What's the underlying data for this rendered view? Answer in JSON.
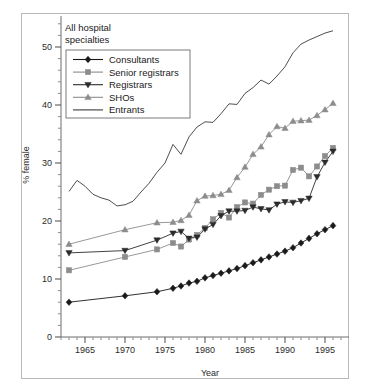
{
  "figure": {
    "annotation_line1": "All hospital",
    "annotation_line2": "specialties",
    "xlabel": "Year",
    "ylabel": "% female"
  },
  "chart_data": {
    "type": "line",
    "title": "All hospital specialties",
    "xlabel": "Year",
    "ylabel": "% female",
    "xlim": [
      1962,
      1997
    ],
    "ylim": [
      0,
      55
    ],
    "xticks": [
      1965,
      1970,
      1975,
      1980,
      1985,
      1990,
      1995
    ],
    "xtick_labels": [
      "1965",
      "1970",
      "1975",
      "1980",
      "1985",
      "1990",
      "1995"
    ],
    "yticks": [
      0,
      10,
      20,
      30,
      40,
      50
    ],
    "ytick_labels": [
      "0",
      "10",
      "20",
      "30",
      "40",
      "50"
    ],
    "minor_x_step": 1,
    "minor_y_step": 2,
    "grid": false,
    "legend_position": "upper-left",
    "series": [
      {
        "name": "Consultants",
        "marker": "diamond",
        "color": "#1a1a1a",
        "x": [
          1963,
          1970,
          1974,
          1976,
          1977,
          1978,
          1979,
          1980,
          1981,
          1982,
          1983,
          1984,
          1985,
          1986,
          1987,
          1988,
          1989,
          1990,
          1991,
          1992,
          1993,
          1994,
          1995,
          1996
        ],
        "y": [
          6.0,
          7.1,
          7.8,
          8.4,
          8.8,
          9.3,
          9.6,
          10.2,
          10.6,
          11.0,
          11.4,
          11.8,
          12.3,
          12.8,
          13.3,
          13.8,
          14.3,
          14.8,
          15.4,
          16.2,
          17.0,
          17.8,
          18.5,
          19.2
        ]
      },
      {
        "name": "Senior registrars",
        "marker": "square",
        "color": "#8c8c8c",
        "x": [
          1963,
          1970,
          1974,
          1976,
          1977,
          1978,
          1979,
          1980,
          1981,
          1982,
          1983,
          1984,
          1985,
          1986,
          1987,
          1988,
          1989,
          1990,
          1991,
          1992,
          1993,
          1994,
          1995,
          1996
        ],
        "y": [
          11.5,
          13.8,
          15.1,
          16.2,
          15.6,
          16.8,
          17.6,
          18.8,
          20.3,
          21.4,
          20.6,
          22.4,
          23.2,
          23.0,
          24.5,
          25.4,
          26.0,
          26.1,
          28.8,
          29.2,
          27.7,
          29.4,
          31.2,
          32.6
        ]
      },
      {
        "name": "Registrars",
        "marker": "triangle-down",
        "color": "#2b2b2b",
        "x": [
          1963,
          1970,
          1974,
          1976,
          1977,
          1978,
          1979,
          1980,
          1981,
          1982,
          1983,
          1984,
          1985,
          1986,
          1987,
          1988,
          1989,
          1990,
          1991,
          1992,
          1993,
          1994,
          1995,
          1996
        ],
        "y": [
          14.5,
          14.9,
          16.7,
          17.9,
          18.2,
          17.0,
          17.2,
          18.6,
          19.4,
          20.9,
          21.7,
          21.7,
          21.8,
          22.4,
          22.1,
          21.9,
          22.9,
          23.3,
          23.2,
          23.5,
          23.9,
          27.6,
          30.1,
          32.0
        ]
      },
      {
        "name": "SHOs",
        "marker": "triangle-up",
        "color": "#8c8c8c",
        "x": [
          1963,
          1970,
          1974,
          1976,
          1977,
          1978,
          1979,
          1980,
          1981,
          1982,
          1983,
          1984,
          1985,
          1986,
          1987,
          1988,
          1989,
          1990,
          1991,
          1992,
          1993,
          1994,
          1995,
          1996
        ],
        "y": [
          16.0,
          18.5,
          19.7,
          19.8,
          20.1,
          21.0,
          23.5,
          24.3,
          24.4,
          24.6,
          25.3,
          27.5,
          29.3,
          31.5,
          32.8,
          34.9,
          36.3,
          36.0,
          37.2,
          37.3,
          37.4,
          38.2,
          39.2,
          40.3
        ]
      },
      {
        "name": "Entrants",
        "marker": "none",
        "color": "#3a3a3a",
        "x": [
          1963,
          1964,
          1965,
          1966,
          1967,
          1968,
          1969,
          1970,
          1971,
          1972,
          1973,
          1974,
          1975,
          1976,
          1977,
          1978,
          1979,
          1980,
          1981,
          1982,
          1983,
          1984,
          1985,
          1986,
          1987,
          1988,
          1989,
          1990,
          1991,
          1992,
          1993,
          1994,
          1995,
          1996
        ],
        "y": [
          25.1,
          27.0,
          26.0,
          24.6,
          24.0,
          23.6,
          22.6,
          22.8,
          23.4,
          25.0,
          26.5,
          28.4,
          30.0,
          33.2,
          31.5,
          34.5,
          36.2,
          37.1,
          37.0,
          38.5,
          40.2,
          40.1,
          42.0,
          43.0,
          44.3,
          43.6,
          45.0,
          46.6,
          49.0,
          50.5,
          51.2,
          51.8,
          52.4,
          52.8
        ]
      }
    ]
  },
  "legend": {
    "entries": [
      {
        "label": "Consultants"
      },
      {
        "label": "Senior registrars"
      },
      {
        "label": "Registrars"
      },
      {
        "label": "SHOs"
      },
      {
        "label": "Entrants"
      }
    ]
  }
}
